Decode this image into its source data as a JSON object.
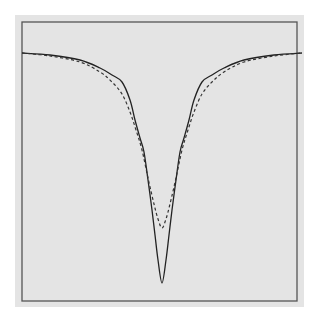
{
  "chart_data": {
    "type": "line",
    "title": "",
    "xlabel": "",
    "ylabel": "",
    "grid": false,
    "legend": null,
    "frame": {
      "x0": 22,
      "y0": 22,
      "x1": 297,
      "y1": 301
    },
    "center_x": 162,
    "baseline_y": 52,
    "series": [
      {
        "name": "solid",
        "style": "solid",
        "color": "#222222",
        "description": "Deep narrow absorption profile",
        "min_y_px": 283,
        "left_points": [
          [
            22,
            53
          ],
          [
            50,
            55
          ],
          [
            80,
            60
          ],
          [
            100,
            68
          ],
          [
            112,
            75
          ],
          [
            122,
            82
          ],
          [
            130,
            100
          ],
          [
            135,
            120
          ],
          [
            140,
            138
          ],
          [
            144,
            152
          ],
          [
            148,
            180
          ],
          [
            152,
            210
          ],
          [
            155,
            235
          ],
          [
            158,
            260
          ],
          [
            162,
            283
          ]
        ]
      },
      {
        "name": "dashed",
        "style": "dashed",
        "color": "#333333",
        "description": "Shallower profile with broader shoulders",
        "min_y_px": 228,
        "left_points": [
          [
            22,
            53
          ],
          [
            50,
            56
          ],
          [
            80,
            62
          ],
          [
            100,
            72
          ],
          [
            112,
            82
          ],
          [
            122,
            94
          ],
          [
            130,
            112
          ],
          [
            136,
            130
          ],
          [
            142,
            150
          ],
          [
            148,
            178
          ],
          [
            154,
            204
          ],
          [
            158,
            219
          ],
          [
            162,
            228
          ]
        ]
      }
    ]
  },
  "caption": {
    "text": ""
  },
  "colors": {
    "panel": "#e4e4e4",
    "frame": "#555555"
  }
}
